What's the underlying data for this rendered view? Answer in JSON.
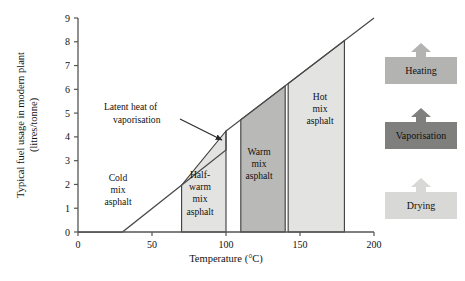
{
  "chart_data": {
    "type": "area",
    "title": "",
    "xlabel": "Temperature (°C)",
    "ylabel": "Typical fuel usage in modern plant (litres/tonne)",
    "ylabel_line1": "Typical fuel usage in modern plant",
    "ylabel_line2": "(litres/tonne)",
    "xlim": [
      0,
      200
    ],
    "ylim": [
      0,
      9
    ],
    "xticks": [
      0,
      50,
      100,
      150,
      200
    ],
    "xticklabels": [
      "0",
      "50",
      "100",
      "150",
      "200"
    ],
    "yticks": [
      0,
      1,
      2,
      3,
      4,
      5,
      6,
      7,
      8,
      9
    ],
    "yticklabels": [
      "0",
      "1",
      "2",
      "3",
      "4",
      "5",
      "6",
      "7",
      "8",
      "9"
    ],
    "grid": false,
    "legend_position": "right-outside",
    "series": [
      {
        "name": "Fuel usage curve",
        "comment": "piecewise: flat-zero to 30C, linear rise to 100C, vertical latent-heat jump at 100C, then linear rise to 200C",
        "x": [
          0,
          30,
          100,
          100,
          200
        ],
        "y": [
          0,
          0,
          3.45,
          4.25,
          9.0
        ]
      }
    ],
    "annotations": [
      {
        "text": "Latent heat of vaporisation",
        "text_line1": "Latent heat of",
        "text_line2": "vaporisation",
        "points_to_x": 100,
        "points_to_y": 3.9
      }
    ],
    "bands": [
      {
        "label": "Cold mix asphalt",
        "label_lines": [
          "Cold",
          "mix",
          "asphalt"
        ],
        "x_start": 0,
        "x_end": 70,
        "fill": "#ffffff",
        "filled": false
      },
      {
        "label": "Half-warm mix asphalt",
        "label_lines": [
          "Half-",
          "warm",
          "mix",
          "asphalt"
        ],
        "x_start": 70,
        "x_end": 100,
        "fill": "#e3e3e1",
        "filled": true
      },
      {
        "label": "Warm mix asphalt",
        "label_lines": [
          "Warm",
          "mix",
          "asphalt"
        ],
        "x_start": 110,
        "x_end": 140,
        "fill": "#b9b9b7",
        "filled": true
      },
      {
        "label": "Hot mix asphalt",
        "label_lines": [
          "Hot",
          "mix",
          "asphalt"
        ],
        "x_start": 142,
        "x_end": 180,
        "fill": "#e3e3e1",
        "filled": true
      }
    ]
  },
  "legend": {
    "items": [
      {
        "label": "Heating",
        "color": "#b3b3b1",
        "arrow_color": "#b3b3b1"
      },
      {
        "label": "Vaporisation",
        "color": "#7f7f7d",
        "arrow_color": "#7f7f7d"
      },
      {
        "label": "Drying",
        "color": "#d8d8d6",
        "arrow_color": "#d8d8d6"
      }
    ]
  },
  "colors": {
    "axis": "#555555",
    "curve": "#4a4a4a",
    "band_light": "#e3e3e1",
    "band_dark": "#b9b9b7",
    "background": "#ffffff"
  }
}
